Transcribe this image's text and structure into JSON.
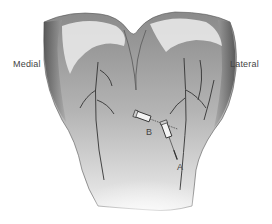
{
  "figure": {
    "labels": {
      "left": "Medial",
      "right": "Lateral"
    },
    "markers": [
      {
        "id": "B",
        "label": "B"
      },
      {
        "id": "A",
        "label": "A"
      }
    ],
    "signature": "artist signature"
  },
  "colors": {
    "background": "#ffffff",
    "shading_dark": "#5a5a5a",
    "shading_mid": "#9a9a9a",
    "shading_light": "#d8d8d8",
    "label_text": "#444444"
  }
}
